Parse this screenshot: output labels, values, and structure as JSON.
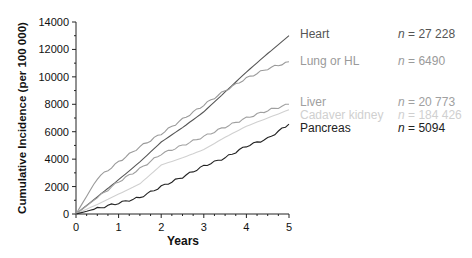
{
  "chart_data": {
    "type": "line",
    "title": "",
    "xlabel": "Years",
    "ylabel": "Cumulative Incidence (per 100 000)",
    "xlim": [
      0,
      5
    ],
    "ylim": [
      0,
      14000
    ],
    "x_ticks": [
      "0",
      "1",
      "2",
      "3",
      "4",
      "5"
    ],
    "y_ticks": [
      "0",
      "2000",
      "4000",
      "6000",
      "8000",
      "10000",
      "12000",
      "14000"
    ],
    "grid": false,
    "legend_position": "right",
    "x": [
      0,
      0.5,
      1,
      1.5,
      2,
      2.5,
      3,
      3.5,
      4,
      4.5,
      5
    ],
    "series": [
      {
        "name": "Heart",
        "n": "27 228",
        "color": "#555555",
        "values": [
          0,
          1250,
          2500,
          3800,
          5250,
          6300,
          7450,
          8900,
          10350,
          11700,
          13000
        ]
      },
      {
        "name": "Lung or HL",
        "n": "6490",
        "color": "#9a9a9a",
        "values": [
          0,
          2600,
          3800,
          4900,
          5850,
          6900,
          7950,
          9000,
          9900,
          10600,
          11100
        ]
      },
      {
        "name": "Liver",
        "n": "20 773",
        "color": "#a0a0a0",
        "values": [
          0,
          1200,
          2350,
          3300,
          4380,
          5000,
          5650,
          6350,
          7000,
          7550,
          8000
        ]
      },
      {
        "name": "Cadaver kidney",
        "n": "184 426",
        "color": "#d0d0d0",
        "values": [
          0,
          700,
          1450,
          2200,
          3570,
          4100,
          4700,
          5600,
          6400,
          7000,
          7600
        ]
      },
      {
        "name": "Pancreas",
        "n": "5094",
        "color": "#222222",
        "values": [
          0,
          400,
          800,
          1200,
          2000,
          2700,
          3500,
          4100,
          4950,
          5500,
          6550
        ]
      }
    ]
  },
  "legend": {
    "n_prefix": "n",
    "n_eq": " = "
  }
}
